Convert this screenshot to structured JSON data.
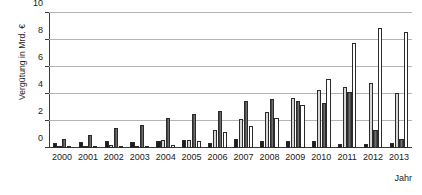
{
  "chart_data": {
    "type": "bar",
    "title": "",
    "xlabel": "Jahr",
    "ylabel": "Vergütung in Mrd. €",
    "ylim": [
      0,
      10
    ],
    "yticks": [
      0,
      2,
      4,
      6,
      8,
      10
    ],
    "ytick_labels": [
      "0",
      "2",
      "4",
      "6",
      "8",
      "10"
    ],
    "grid": true,
    "legend_position": "none",
    "categories": [
      "2000",
      "2001",
      "2002",
      "2003",
      "2004",
      "2005",
      "2006",
      "2007",
      "2008",
      "2009",
      "2010",
      "2011",
      "2012",
      "2013"
    ],
    "series": [
      {
        "name": "Serie 1",
        "color": "#1c1c1c",
        "values": [
          0.4,
          0.45,
          0.5,
          0.45,
          0.5,
          0.6,
          0.4,
          0.65,
          0.5,
          0.55,
          0.5,
          0.3,
          0.3,
          0.35
        ]
      },
      {
        "name": "Serie 2",
        "color": "#d6d6d6",
        "values": [
          0.05,
          0.05,
          0.25,
          0.05,
          0.6,
          0.6,
          1.35,
          2.15,
          2.7,
          3.7,
          4.3,
          4.5,
          4.85,
          4.05
        ]
      },
      {
        "name": "Serie 3",
        "color": "#595959",
        "values": [
          0.7,
          0.95,
          1.45,
          1.7,
          2.2,
          2.5,
          2.75,
          3.5,
          3.6,
          3.45,
          3.3,
          4.15,
          1.3,
          0.7
        ]
      },
      {
        "name": "Serie 4",
        "color": "#ffffff",
        "values": [
          0.02,
          0.05,
          0.08,
          0.15,
          0.2,
          0.5,
          1.15,
          1.6,
          2.2,
          3.2,
          5.1,
          7.75,
          8.9,
          8.6
        ]
      }
    ]
  }
}
